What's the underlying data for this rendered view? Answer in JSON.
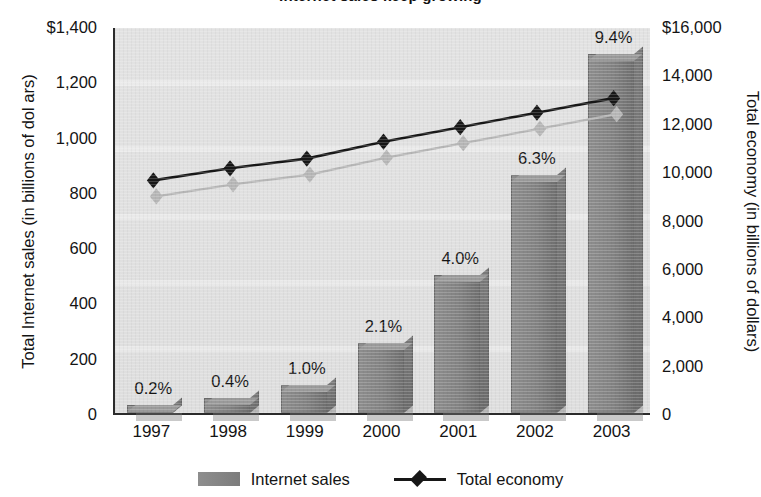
{
  "chart_data": {
    "type": "bar",
    "title": "Internet sales keep growing",
    "categories": [
      "1997",
      "1998",
      "1999",
      "2000",
      "2001",
      "2002",
      "2003"
    ],
    "series": [
      {
        "name": "Internet sales",
        "kind": "bar",
        "axis": "left",
        "values": [
          30,
          55,
          100,
          255,
          500,
          860,
          1300
        ],
        "point_labels": [
          "0.2%",
          "0.4%",
          "1.0%",
          "2.1%",
          "4.0%",
          "6.3%",
          "9.4%"
        ],
        "color": "#828282"
      },
      {
        "name": "Total economy",
        "kind": "line",
        "axis": "right",
        "values": [
          9700,
          10200,
          10600,
          11300,
          11900,
          12500,
          13100
        ],
        "color": "#171717",
        "marker": "diamond"
      }
    ],
    "ylabel": "Total Internet sales (in billions of dol ars)",
    "ylabel_right": "Total economy (in billions of dollars)",
    "xlabel": "",
    "ylim": [
      0,
      1400
    ],
    "ylim_right": [
      0,
      16000
    ],
    "yticks_left": [
      "$1,400",
      "1,200",
      "1,000",
      "800",
      "600",
      "400",
      "200",
      "0"
    ],
    "yticks_right": [
      "$16,000",
      "14,000",
      "12,000",
      "10,000",
      "8,000",
      "6,000",
      "4,000",
      "2,000",
      "0"
    ],
    "grid": false,
    "legend_position": "bottom",
    "plot_background": "#e0e0e0"
  },
  "legend": {
    "bar_label": "Internet sales",
    "line_label": "Total economy"
  }
}
